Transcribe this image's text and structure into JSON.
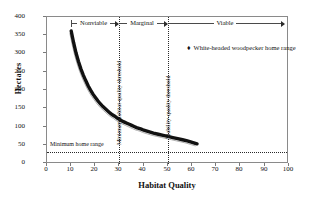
{
  "chart_data": {
    "type": "scatter",
    "title": "",
    "xlabel": "Habitat Quality",
    "ylabel": "Hectares",
    "xlim": [
      0,
      100
    ],
    "ylim": [
      0,
      400
    ],
    "xticks": [
      0,
      10,
      20,
      30,
      40,
      50,
      60,
      70,
      80,
      90,
      100
    ],
    "yticks": [
      0,
      50,
      100,
      150,
      200,
      250,
      300,
      350,
      400
    ],
    "grid": false,
    "legend_position": "inside-top-right",
    "series": [
      {
        "name": "White-headed woodpecker home range",
        "marker": "♦",
        "x": [
          10,
          11,
          12,
          13,
          14,
          15,
          16,
          17,
          18,
          19,
          20,
          21,
          22,
          23,
          24,
          25,
          26,
          27,
          28,
          29,
          30,
          31,
          32,
          33,
          34,
          35,
          36,
          37,
          38,
          39,
          40,
          42,
          44,
          46,
          48,
          50,
          52,
          54,
          56,
          58,
          60,
          62
        ],
        "y": [
          362,
          330,
          302,
          279,
          259,
          242,
          227,
          213,
          201,
          190,
          181,
          172,
          164,
          157,
          151,
          145,
          139,
          134,
          130,
          125,
          121,
          117,
          114,
          111,
          108,
          105,
          102,
          99,
          97,
          95,
          92,
          88,
          84,
          81,
          78,
          75,
          72,
          69,
          66,
          63,
          59,
          55
        ]
      }
    ],
    "reference_lines": [
      {
        "name": "Minimum habitat-quality threshold",
        "orientation": "vertical",
        "value": 30,
        "style": "dotted"
      },
      {
        "name": "Viability-quality threshold",
        "orientation": "vertical",
        "value": 50,
        "style": "dotted"
      },
      {
        "name": "Minimum home range",
        "orientation": "horizontal",
        "value": 32,
        "style": "dotted"
      }
    ],
    "annotations": [
      {
        "name": "Nonviable",
        "from": 10,
        "to": 30
      },
      {
        "name": "Marginal",
        "from": 30,
        "to": 50
      },
      {
        "name": "Viable",
        "from": 50,
        "to": 100
      }
    ]
  },
  "axes": {
    "y_title": "Hectares",
    "x_title": "Habitat Quality",
    "y_tick_labels": [
      "400",
      "350",
      "300",
      "250",
      "200",
      "150",
      "100",
      "50",
      "0"
    ],
    "x_tick_labels": [
      "0",
      "10",
      "20",
      "30",
      "40",
      "50",
      "60",
      "70",
      "80",
      "90",
      "100"
    ]
  },
  "bands": {
    "nonviable": "Nonviable",
    "marginal": "Marginal",
    "viable": "Viable"
  },
  "reference_labels": {
    "min_habitat_quality_threshold": "Minimum habitat-quality threshold",
    "viability_quality_threshold": "Viability-quality threshold",
    "minimum_home_range": "Minimum home range"
  },
  "legend": {
    "marker": "♦",
    "label": "White-headed woodpecker home range"
  }
}
